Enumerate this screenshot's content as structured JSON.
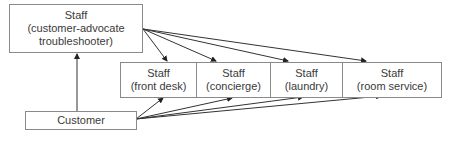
{
  "diagram": {
    "top_box": {
      "line1": "Staff",
      "line2": "(customer-advocate",
      "line3": "troubleshooter)"
    },
    "staff_boxes": [
      {
        "line1": "Staff",
        "line2": "(front desk)"
      },
      {
        "line1": "Staff",
        "line2": "(concierge)"
      },
      {
        "line1": "Staff",
        "line2": "(laundry)"
      },
      {
        "line1": "Staff",
        "line2": "(room service)"
      }
    ],
    "customer_box": {
      "label": "Customer"
    },
    "edges": [
      {
        "from": "customer",
        "to": "customer-advocate-troubleshooter"
      },
      {
        "from": "customer-advocate-troubleshooter",
        "to": "front desk"
      },
      {
        "from": "customer-advocate-troubleshooter",
        "to": "concierge"
      },
      {
        "from": "customer-advocate-troubleshooter",
        "to": "laundry"
      },
      {
        "from": "customer-advocate-troubleshooter",
        "to": "room service"
      },
      {
        "from": "customer",
        "to": "front desk"
      },
      {
        "from": "customer",
        "to": "concierge"
      },
      {
        "from": "customer",
        "to": "laundry"
      },
      {
        "from": "customer",
        "to": "room service"
      }
    ]
  }
}
